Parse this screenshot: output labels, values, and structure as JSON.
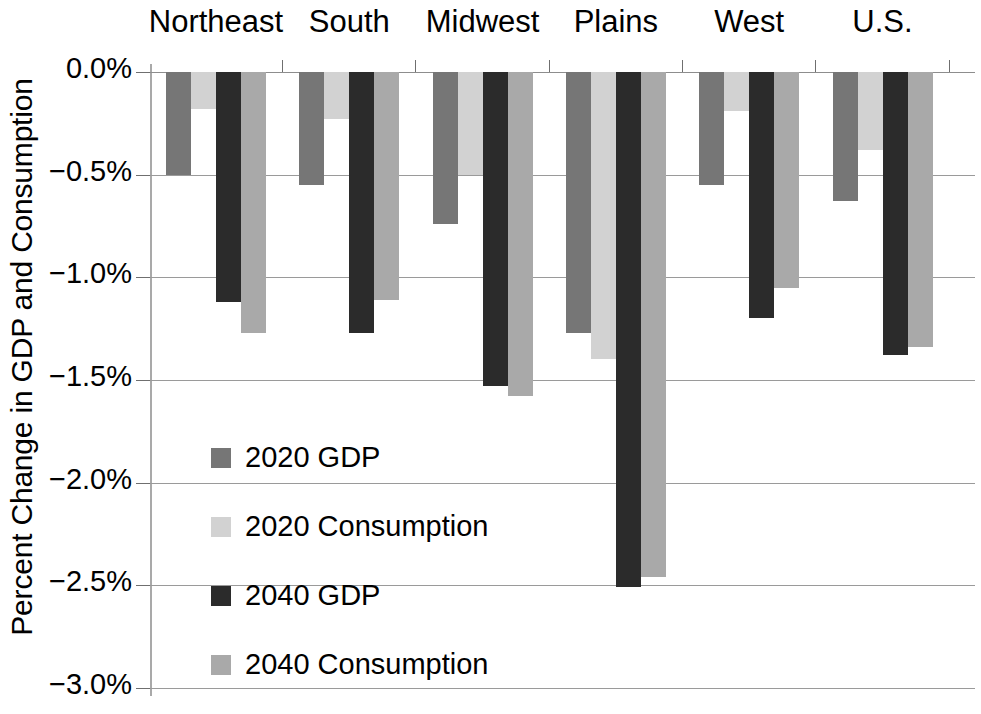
{
  "chart_data": {
    "type": "bar",
    "title": "",
    "subtitle": "",
    "xlabel": "",
    "ylabel": "Percent Change in GDP and Consumption",
    "categories": [
      "Northeast",
      "South",
      "Midwest",
      "Plains",
      "West",
      "U.S."
    ],
    "series": [
      {
        "name": "2020 GDP",
        "color": "#767676",
        "values": [
          -0.5,
          -0.55,
          -0.74,
          -1.27,
          -0.55,
          -0.63
        ]
      },
      {
        "name": "2020 Consumption",
        "color": "#d2d2d2",
        "values": [
          -0.18,
          -0.23,
          -0.5,
          -1.4,
          -0.19,
          -0.38
        ]
      },
      {
        "name": "2040 GDP",
        "color": "#2b2b2b",
        "values": [
          -1.12,
          -1.27,
          -1.53,
          -2.51,
          -1.2,
          -1.38
        ]
      },
      {
        "name": "2040 Consumption",
        "color": "#a9a9a9",
        "values": [
          -1.27,
          -1.11,
          -1.58,
          -2.46,
          -1.05,
          -1.34
        ]
      }
    ],
    "ylim": [
      -3.0,
      0.0
    ],
    "ytick_values": [
      0.0,
      -0.5,
      -1.0,
      -1.5,
      -2.0,
      -2.5,
      -3.0
    ],
    "ytick_labels": [
      "0.0%",
      "−0.5%",
      "−1.0%",
      "−1.5%",
      "−2.0%",
      "−2.5%",
      "−3.0%"
    ],
    "grid": true,
    "grid_axis": "y",
    "legend_position": "inside-left",
    "category_axis_position": "top",
    "units": "percent"
  }
}
